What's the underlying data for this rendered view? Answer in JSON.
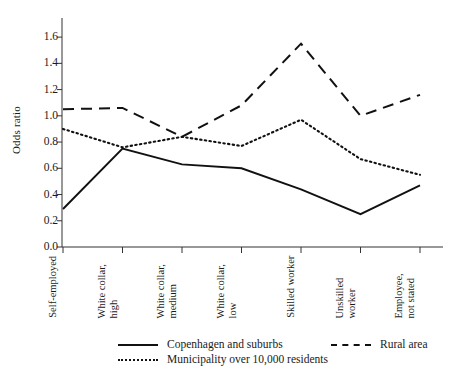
{
  "chart_data": {
    "type": "line",
    "title": "",
    "xlabel": "",
    "ylabel": "Odds ratio",
    "ylim": [
      0.0,
      1.7
    ],
    "yticks": [
      "0.0",
      "0.2",
      "0.4",
      "0.6",
      "0.8",
      "1.0",
      "1.2",
      "1.4",
      "1.6"
    ],
    "ytick_values": [
      0.0,
      0.2,
      0.4,
      0.6,
      0.8,
      1.0,
      1.2,
      1.4,
      1.6
    ],
    "grid": false,
    "legend_position": "bottom",
    "categories": [
      "Self-employed",
      "White collar, high",
      "White collar, medium",
      "White collar, low",
      "Skilled worker",
      "Unskilled worker",
      "Employee, not stated"
    ],
    "category_lines": [
      [
        "Self-employed"
      ],
      [
        "White collar,",
        "high"
      ],
      [
        "White collar,",
        "medium"
      ],
      [
        "White collar,",
        "low"
      ],
      [
        "Skilled worker"
      ],
      [
        "Unskilled",
        "worker"
      ],
      [
        "Employee,",
        "not stated"
      ]
    ],
    "series": [
      {
        "name": "Copenhagen and suburbs",
        "style": "solid",
        "color": "#111111",
        "values": [
          0.29,
          0.75,
          0.63,
          0.6,
          0.44,
          0.25,
          0.47
        ]
      },
      {
        "name": "Rural area",
        "style": "dashed",
        "color": "#111111",
        "values": [
          1.05,
          1.06,
          0.84,
          1.08,
          1.55,
          1.0,
          1.16
        ]
      },
      {
        "name": "Municipality over 10,000 residents",
        "style": "dotted",
        "color": "#111111",
        "values": [
          0.9,
          0.76,
          0.84,
          0.77,
          0.97,
          0.67,
          0.55
        ]
      }
    ]
  },
  "legend": {
    "items": [
      {
        "label": "Copenhagen and suburbs",
        "style": "solid"
      },
      {
        "label": "Rural area",
        "style": "dashed"
      },
      {
        "label": "Municipality over 10,000 residents",
        "style": "dotted"
      }
    ]
  }
}
